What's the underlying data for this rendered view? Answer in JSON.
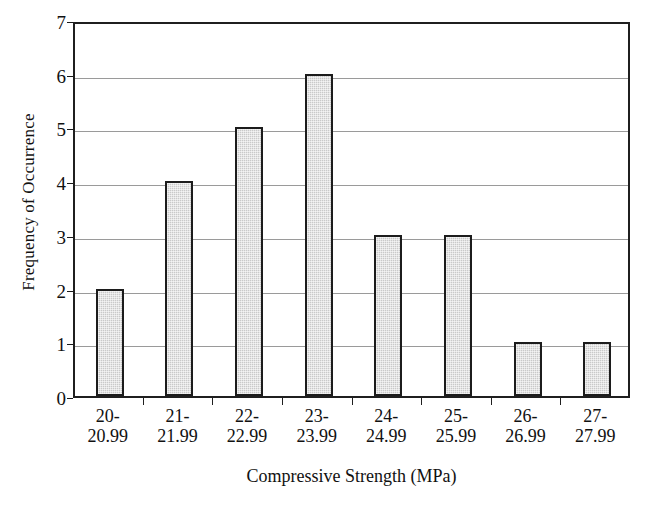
{
  "chart_data": {
    "type": "bar",
    "title": "",
    "xlabel": "Compressive Strength (MPa)",
    "ylabel": "Frequency of Occurrence",
    "categories": [
      "20-20.99",
      "21-21.99",
      "22-22.99",
      "23-23.99",
      "24-24.99",
      "25-25.99",
      "26-26.99",
      "27-27.99"
    ],
    "category_lines": [
      {
        "line1": "20-",
        "line2": "20.99"
      },
      {
        "line1": "21-",
        "line2": "21.99"
      },
      {
        "line1": "22-",
        "line2": "22.99"
      },
      {
        "line1": "23-",
        "line2": "23.99"
      },
      {
        "line1": "24-",
        "line2": "24.99"
      },
      {
        "line1": "25-",
        "line2": "25.99"
      },
      {
        "line1": "26-",
        "line2": "26.99"
      },
      {
        "line1": "27-",
        "line2": "27.99"
      }
    ],
    "values": [
      2,
      4,
      5,
      6,
      3,
      3,
      1,
      1
    ],
    "ylim": [
      0,
      7
    ],
    "ytick_labels": [
      "0",
      "1",
      "2",
      "3",
      "4",
      "5",
      "6",
      "7"
    ],
    "ytick_values": [
      0,
      1,
      2,
      3,
      4,
      5,
      6,
      7
    ],
    "grid": true,
    "legend": false,
    "bar_fill_color": "#c9c9c9",
    "bar_border_color": "#1c1c1c",
    "gridline_color": "#9a9a9a",
    "axis_color": "#1f1f1f",
    "background_color": "#ffffff"
  }
}
